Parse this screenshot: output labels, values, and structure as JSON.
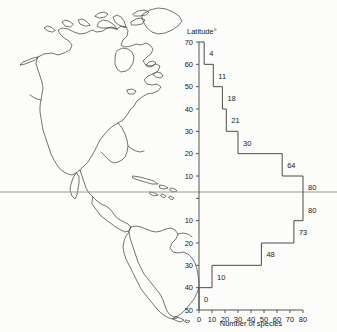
{
  "figure": {
    "background_color": "#fcfcfa",
    "map": {
      "name": "americas-outline-map",
      "description": "Outline map of North and South America",
      "equator_line": true,
      "line_color": "#3a3a3a"
    }
  },
  "chart_data": {
    "type": "bar",
    "orientation": "horizontal",
    "title": "",
    "xlabel": "Number of species",
    "ylabel": "Latitude°",
    "ylim": [
      -50,
      70
    ],
    "xlim": [
      0,
      80
    ],
    "grid": false,
    "x_ticks": [
      0,
      10,
      20,
      30,
      40,
      50,
      60,
      70,
      80
    ],
    "x_tick_labels": [
      "0",
      "10",
      "20",
      "30",
      "40",
      "50",
      "60",
      "70",
      "80"
    ],
    "y_ticks": [
      70,
      60,
      50,
      40,
      30,
      20,
      10,
      0,
      -10,
      -20,
      -30,
      -40,
      -50
    ],
    "y_tick_labels": [
      "70",
      "60",
      "50",
      "40",
      "30",
      "20",
      "10",
      "",
      "10",
      "20",
      "30",
      "40",
      "50"
    ],
    "categories": [
      "60-70",
      "50-60",
      "40-50",
      "30-40",
      "20-30",
      "10-20",
      "0-10",
      "0-10 S",
      "10-20 S",
      "20-30 S",
      "30-40 S",
      "40-50 S"
    ],
    "band_tops": [
      70,
      60,
      50,
      40,
      30,
      20,
      10,
      0,
      -10,
      -20,
      -30,
      -40
    ],
    "band_bottoms": [
      60,
      50,
      40,
      30,
      20,
      10,
      0,
      -10,
      -20,
      -30,
      -40,
      -50
    ],
    "values": [
      4,
      11,
      18,
      21,
      30,
      64,
      80,
      80,
      73,
      48,
      10,
      0
    ],
    "value_labels": [
      "4",
      "11",
      "18",
      "21",
      "30",
      "64",
      "80",
      "80",
      "73",
      "48",
      "10",
      "0"
    ]
  }
}
